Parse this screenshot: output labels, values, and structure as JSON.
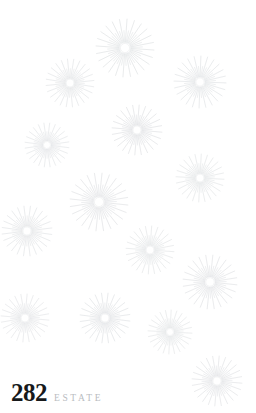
{
  "canvas": {
    "width": 256,
    "height": 413,
    "background_color": "#ffffff"
  },
  "brand": {
    "number": "282",
    "word": "ESTATE",
    "number_color": "#17191b",
    "word_color": "#b9bcbf"
  },
  "decoration": {
    "motif_name": "starburst",
    "motif_color": "#d6d9dc",
    "motif_core_color": "#e8eaec",
    "count": 13,
    "rays_long": 24,
    "rays_short": 24,
    "bursts": [
      {
        "cx": 125,
        "cy": 48,
        "r": 29,
        "rot": 4,
        "opacity": 0.92
      },
      {
        "cx": 70,
        "cy": 83,
        "r": 24,
        "rot": 9,
        "opacity": 0.8
      },
      {
        "cx": 200,
        "cy": 82,
        "r": 26,
        "rot": 2,
        "opacity": 0.88
      },
      {
        "cx": 47,
        "cy": 145,
        "r": 22,
        "rot": 7,
        "opacity": 0.78
      },
      {
        "cx": 137,
        "cy": 130,
        "r": 25,
        "rot": 5,
        "opacity": 0.9
      },
      {
        "cx": 200,
        "cy": 178,
        "r": 24,
        "rot": 3,
        "opacity": 0.82
      },
      {
        "cx": 99,
        "cy": 202,
        "r": 29,
        "rot": 6,
        "opacity": 0.9
      },
      {
        "cx": 27,
        "cy": 231,
        "r": 25,
        "rot": 8,
        "opacity": 0.82
      },
      {
        "cx": 150,
        "cy": 250,
        "r": 24,
        "rot": 4,
        "opacity": 0.8
      },
      {
        "cx": 210,
        "cy": 282,
        "r": 27,
        "rot": 6,
        "opacity": 0.88
      },
      {
        "cx": 25,
        "cy": 318,
        "r": 24,
        "rot": 5,
        "opacity": 0.78
      },
      {
        "cx": 105,
        "cy": 318,
        "r": 25,
        "rot": 7,
        "opacity": 0.88
      },
      {
        "cx": 170,
        "cy": 332,
        "r": 22,
        "rot": 3,
        "opacity": 0.78
      },
      {
        "cx": 217,
        "cy": 381,
        "r": 25,
        "rot": 5,
        "opacity": 0.85
      }
    ]
  }
}
